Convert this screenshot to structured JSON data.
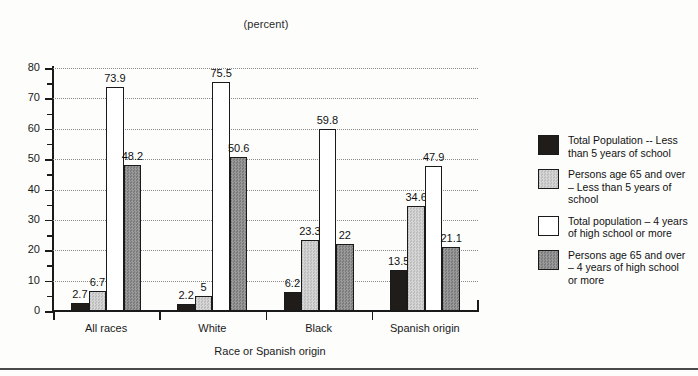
{
  "chart_data": {
    "type": "bar",
    "title": "(percent)",
    "xlabel": "Race or Spanish origin",
    "ylabel": "",
    "ylim": [
      0,
      80
    ],
    "ytick_step": 10,
    "yticks": [
      "0",
      "10",
      "20",
      "30",
      "40",
      "50",
      "60",
      "70",
      "80"
    ],
    "minor_tick_step": 5,
    "grid": true,
    "legend_position": "right",
    "categories": [
      "All races",
      "White",
      "Black",
      "Spanish origin"
    ],
    "series": [
      {
        "name": "Total Population -- Less than 5 years of school",
        "values": [
          2.7,
          2.2,
          6.2,
          13.5
        ],
        "labels": [
          "2.7",
          "2.2",
          "6.2",
          "13.5"
        ],
        "color": "#1f1c19"
      },
      {
        "name": "Persons age 65 and over – Less than 5 years of school",
        "values": [
          6.7,
          5,
          23.3,
          34.6
        ],
        "labels": [
          "6.7",
          "5",
          "23.3",
          "34.6"
        ],
        "color": "#c9c9c9"
      },
      {
        "name": "Total  population – 4 years of high school  or more",
        "values": [
          73.9,
          75.5,
          59.8,
          47.9
        ],
        "labels": [
          "73.9",
          "75.5",
          "59.8",
          "47.9"
        ],
        "color": "#ffffff"
      },
      {
        "name": "Persons age 65 and over – 4 years of high school or more",
        "values": [
          48.2,
          50.6,
          22,
          21.1
        ],
        "labels": [
          "48.2",
          "50.6",
          "22",
          "21.1"
        ],
        "color": "#8d8d8d"
      }
    ]
  },
  "legend": {
    "items": [
      {
        "label": "Total Population -- Less than 5 years of school",
        "swatch": "black-swatch"
      },
      {
        "label": "Persons age 65 and over – Less than 5 years of school",
        "swatch": "light-gray-swatch"
      },
      {
        "label": "Total  population – 4 years of high school  or more",
        "swatch": "white-swatch"
      },
      {
        "label": "Persons age 65 and over – 4 years of high school or more",
        "swatch": "dark-gray-swatch"
      }
    ]
  }
}
